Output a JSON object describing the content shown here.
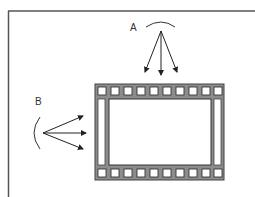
{
  "diagram": {
    "labels": {
      "a": "A",
      "b": "B"
    },
    "film_strip": {
      "perforations_per_row": 10,
      "frame_fill": "#ffffff",
      "strip_color": "#8c8c8c"
    },
    "light_sources": [
      {
        "id": "A",
        "position": "top",
        "arrow_count": 3,
        "direction": "down"
      },
      {
        "id": "B",
        "position": "left",
        "arrow_count": 3,
        "direction": "right"
      }
    ],
    "colors": {
      "line": "#333333",
      "border": "#555555",
      "background": "#ffffff"
    }
  }
}
